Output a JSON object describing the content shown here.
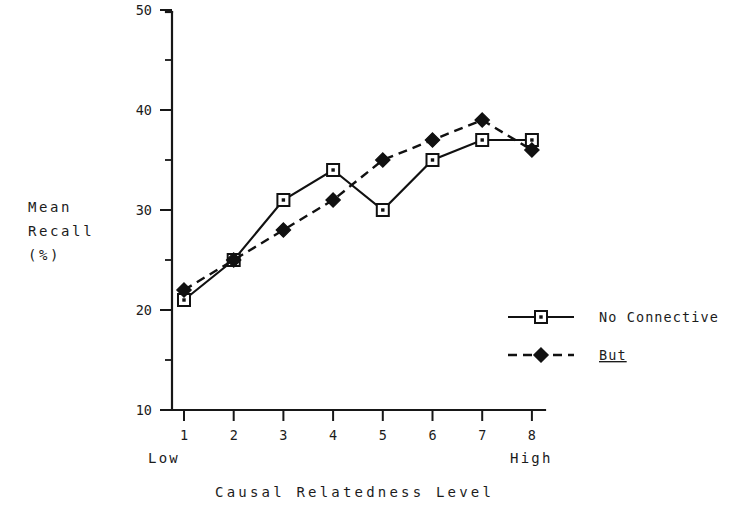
{
  "chart_data": {
    "type": "line",
    "title": "",
    "xlabel": "Causal  Relatedness  Level",
    "ylabel": "Mean Recall (%)",
    "ylabel_lines": [
      "Mean",
      "Recall",
      "(%)"
    ],
    "x": [
      1,
      2,
      3,
      4,
      5,
      6,
      7,
      8
    ],
    "categories": [
      "1",
      "2",
      "3",
      "4",
      "5",
      "6",
      "7",
      "8"
    ],
    "xlim": [
      0.75,
      8.35
    ],
    "ylim": [
      10,
      50
    ],
    "y_ticks_major": [
      10,
      20,
      30,
      40,
      50
    ],
    "y_ticks_major_labels": [
      "10",
      "20",
      "30",
      "40",
      "50"
    ],
    "y_ticks_minor": [
      15,
      25,
      35,
      45
    ],
    "grid": false,
    "legend_position": "inside-right",
    "x_axis_low_label": "Low",
    "x_axis_high_label": "High",
    "series": [
      {
        "name": "No Connective",
        "values": [
          21,
          25,
          31,
          34,
          30,
          35,
          37,
          37
        ],
        "linestyle": "solid",
        "marker": "open-square",
        "color": "#111111"
      },
      {
        "name": "But",
        "values": [
          22,
          25,
          28,
          31,
          35,
          37,
          39,
          36
        ],
        "linestyle": "dashed",
        "marker": "filled-diamond",
        "color": "#111111",
        "label_underlined": true
      }
    ]
  },
  "legend": {
    "items": [
      {
        "label": "No Connective",
        "style": "solid-open-square"
      },
      {
        "label": "But",
        "style": "dashed-filled-diamond"
      }
    ]
  },
  "axis": {
    "y_label_line1": "Mean",
    "y_label_line2": "Recall",
    "y_label_line3": "(%)",
    "x_title": "Causal  Relatedness  Level",
    "low": "Low",
    "high": "High"
  },
  "colors": {
    "ink": "#111111",
    "background": "#ffffff"
  }
}
